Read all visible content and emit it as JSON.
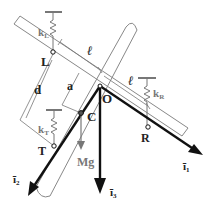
{
  "diagram": {
    "points": {
      "L": "L",
      "R": "R",
      "O": "O",
      "T": "T",
      "C": "C"
    },
    "springs": {
      "left": "k",
      "left_sub": "L",
      "right": "k",
      "right_sub": "R",
      "tail": "k",
      "tail_sub": "T"
    },
    "dimensions": {
      "ell_1": "ℓ",
      "ell_2": "ℓ",
      "a": "a",
      "d": "d"
    },
    "force": "Mg",
    "axes": {
      "i1": "ī",
      "i1_sub": "1",
      "i2": "ī",
      "i2_sub": "2",
      "i3": "ī",
      "i3_sub": "3"
    },
    "colors": {
      "line": "#111111",
      "gray": "#777777",
      "body": "#888888"
    }
  }
}
